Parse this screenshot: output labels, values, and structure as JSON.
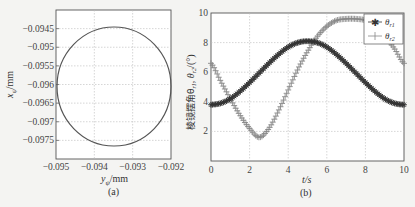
{
  "chart_data": [
    {
      "type": "line",
      "panel": "(a)",
      "title": "",
      "xlabel": "y_ψ/mm",
      "ylabel": "x_ψ/mm",
      "xlim": [
        -0.095,
        -0.092
      ],
      "ylim": [
        -0.098,
        -0.094
      ],
      "xticks": [
        -0.095,
        -0.094,
        -0.093,
        -0.092
      ],
      "xtick_labels": [
        "−0.095",
        "−0.094",
        "−0.093",
        "−0.092"
      ],
      "yticks": [
        -0.0945,
        -0.095,
        -0.0955,
        -0.096,
        -0.0965,
        -0.097,
        -0.0975
      ],
      "ytick_labels": [
        "−0.0945",
        "−0.095",
        "−0.0955",
        "−0.096",
        "−0.0965",
        "−0.097",
        "−0.0975"
      ],
      "grid": true,
      "series": [
        {
          "name": "trajectory",
          "shape": "circle",
          "center": [
            -0.0935,
            -0.096
          ],
          "radius_x": 0.0015,
          "radius_y": 0.0015,
          "color": "#555555"
        }
      ]
    },
    {
      "type": "line",
      "panel": "(b)",
      "title": "",
      "xlabel": "t/s",
      "ylabel": "棱镜摆角θ_r1, θ_r2/(°)",
      "xlim": [
        0,
        10
      ],
      "ylim": [
        0,
        10
      ],
      "xticks": [
        0,
        2,
        4,
        6,
        8,
        10
      ],
      "yticks": [
        2,
        4,
        6,
        8,
        10
      ],
      "grid": true,
      "legend_position": "upper right",
      "x": [
        0,
        0.5,
        1,
        1.5,
        2,
        2.5,
        3,
        3.5,
        4,
        4.5,
        5,
        5.5,
        6,
        6.5,
        7,
        7.5,
        8,
        8.5,
        9,
        9.5,
        10
      ],
      "series": [
        {
          "name": "θ_r1",
          "marker": "*",
          "color": "#333333",
          "values": [
            3.8,
            3.9,
            4.2,
            4.7,
            5.3,
            5.95,
            6.6,
            7.2,
            7.7,
            8.0,
            8.1,
            8.0,
            7.7,
            7.2,
            6.6,
            5.95,
            5.3,
            4.7,
            4.2,
            3.9,
            3.8
          ]
        },
        {
          "name": "θ_r2",
          "marker": "+",
          "color": "#888888",
          "values": [
            6.6,
            5.4,
            4.2,
            3.1,
            2.2,
            1.6,
            2.2,
            3.4,
            4.8,
            6.2,
            7.4,
            8.4,
            9.1,
            9.5,
            9.6,
            9.6,
            9.5,
            9.1,
            8.4,
            7.6,
            6.6
          ]
        }
      ]
    }
  ],
  "labels": {
    "a": {
      "xlabel_main": "y",
      "xlabel_sub": "ψ",
      "xlabel_unit": "/mm",
      "ylabel_main": "x",
      "ylabel_sub": "ψ",
      "ylabel_unit": "/mm",
      "caption": "(a)",
      "xt": [
        "−0.095",
        "−0.094",
        "−0.093",
        "−0.092"
      ],
      "yt": [
        "−0.0945",
        "−0.095",
        "−0.0955",
        "−0.096",
        "−0.0965",
        "−0.097",
        "−0.0975"
      ]
    },
    "b": {
      "xlabel": "t/s",
      "ylabel": "棱镜摆角θ",
      "ylabel_sub1": "r1",
      "ylabel_mid": ", θ",
      "ylabel_sub2": "r2",
      "ylabel_unit": "/(°)",
      "caption": "(b)",
      "xt": [
        "0",
        "2",
        "4",
        "6",
        "8",
        "10"
      ],
      "yt": [
        "2",
        "4",
        "6",
        "8",
        "10"
      ],
      "legend": [
        {
          "sym": "θ",
          "sub": "r1"
        },
        {
          "sym": "θ",
          "sub": "r2"
        }
      ]
    }
  }
}
